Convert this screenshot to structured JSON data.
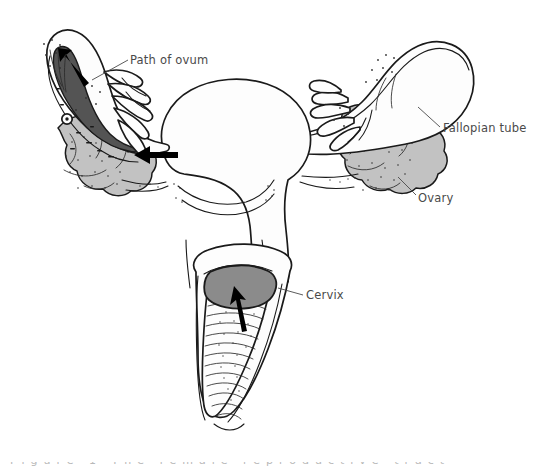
{
  "figure": {
    "kind": "anatomical-line-drawing",
    "background_color": "#ffffff",
    "line_color": "#1a1a1a",
    "label_color": "#4a4a4a"
  },
  "labels": {
    "path_of_ovum": "Path of ovum",
    "fallopian_tube": "Fallopian tube",
    "ovary": "Ovary",
    "cervix": "Cervix"
  },
  "structures": [
    {
      "name": "fallopian-tube-left",
      "label": "Fallopian tube",
      "side": "left",
      "fill": "#fdfdfd",
      "description": "Left uterine tube shown cut away, curving up and over the left ovary with a fimbriated infundibulum at its free end"
    },
    {
      "name": "fallopian-tube-lumen-left",
      "label": "Tube lumen",
      "side": "left",
      "fill": "#545454",
      "description": "Dark cut-away interior of the left fallopian tube containing the released ovum"
    },
    {
      "name": "ovum",
      "label": "Ovum",
      "side": "left",
      "fill": "#ffffff",
      "description": "Small round ovum within the dark tube lumen"
    },
    {
      "name": "ovary-left",
      "label": "Ovary",
      "side": "left",
      "fill": "#c2c2c2",
      "description": "Left ovary drawn as a lobulated stippled gray mass beneath the tube"
    },
    {
      "name": "fimbriae-left",
      "label": "Fimbriae",
      "side": "left",
      "fill": "#fdfdfd",
      "description": "Finger-like fimbriae at the open end of the left tube"
    },
    {
      "name": "uterus",
      "label": "Uterus",
      "side": "center",
      "fill": "#fdfdfd",
      "description": "Pear-shaped uterine body with fundus above and internal contour lines"
    },
    {
      "name": "fallopian-tube-right",
      "label": "Fallopian tube",
      "side": "right",
      "fill": "#fdfdfd",
      "description": "Right uterine tube arching up and laterally to a fimbriated end"
    },
    {
      "name": "ovary-right",
      "label": "Ovary",
      "side": "right",
      "fill": "#c2c2c2",
      "description": "Right ovary as a lobulated stippled gray mass under the arching tube"
    },
    {
      "name": "fimbriae-right",
      "label": "Fimbriae",
      "side": "right",
      "fill": "#fdfdfd",
      "description": "Finger-like fimbriae at the open end of the right tube"
    },
    {
      "name": "cervix",
      "label": "Cervix",
      "side": "center",
      "fill": "#8b8b8b",
      "description": "Rounded gray cervix projecting into the top of the cut-open vagina"
    },
    {
      "name": "vagina",
      "label": "Vagina",
      "side": "center",
      "fill": "#fdfdfd",
      "description": "Vagina opened longitudinally to show transverse rugae along its inner wall"
    }
  ],
  "arrows": [
    {
      "name": "arrow-path-of-ovum",
      "points_to": "fimbriae-left",
      "direction": "up-left",
      "description": "Solid black arrow inside the left tube showing the ovum travelling toward the uterus"
    },
    {
      "name": "arrow-tube-to-uterus",
      "points_to": "uterus",
      "direction": "left",
      "description": "Solid black arrow at the left cornu pointing into the uterine cavity"
    },
    {
      "name": "arrow-vagina-to-cervix",
      "points_to": "cervix",
      "direction": "up",
      "description": "Solid black arrow in the vagina pointing up at the cervix"
    }
  ],
  "bottom_edge": {
    "clipped_caption": "Figure 1 The female reproductive tract"
  }
}
